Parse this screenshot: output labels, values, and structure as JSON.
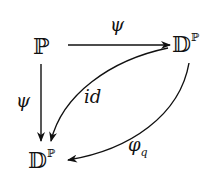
{
  "diagram": {
    "type": "commutative-diagram",
    "nodes": {
      "top_left": {
        "base": "ℙ",
        "sup": ""
      },
      "top_right": {
        "base": "𝔻",
        "sup": "ℙ"
      },
      "bottom_left": {
        "base": "𝔻",
        "sup": "ℙ"
      }
    },
    "arrows": {
      "top": {
        "from": "top_left",
        "to": "top_right",
        "label": "ψ",
        "sub": ""
      },
      "left": {
        "from": "top_left",
        "to": "bottom_left",
        "label": "ψ",
        "sub": ""
      },
      "id_curve": {
        "from": "top_right",
        "to": "bottom_left",
        "label": "id",
        "sub": ""
      },
      "phi_curve": {
        "from": "top_right",
        "to": "bottom_left",
        "label": "φ",
        "sub": "q"
      }
    }
  }
}
